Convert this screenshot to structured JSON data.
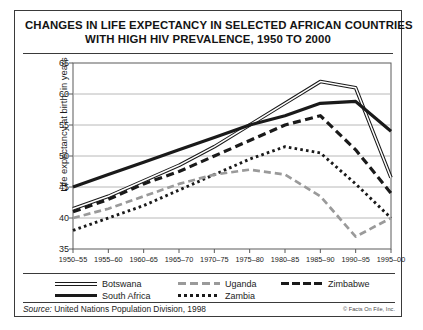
{
  "title": {
    "line1": "CHANGES IN LIFE EXPECTANCY IN SELECTED AFRICAN COUNTRIES",
    "line2": "WITH HIGH HIV PREVALENCE, 1950 TO 2000"
  },
  "source": {
    "prefix": "Source:",
    "text": " United Nations Population Division, 1998",
    "copyright": "© Facts On File, Inc."
  },
  "legend": {
    "items": [
      {
        "label": "Botswana",
        "style": "sw-double",
        "x": 32,
        "y": 4
      },
      {
        "label": "Uganda",
        "style": "sw-grayd",
        "x": 155,
        "y": 4
      },
      {
        "label": "Zimbabwe",
        "style": "sw-boldd",
        "x": 258,
        "y": 4
      },
      {
        "label": "South Africa",
        "style": "sw-solid",
        "x": 32,
        "y": 16
      },
      {
        "label": "Zambia",
        "style": "sw-dot",
        "x": 155,
        "y": 16
      }
    ]
  },
  "chart_data": {
    "type": "line",
    "title": "Changes in life expectancy in selected African countries with high HIV prevalence, 1950 to 2000",
    "xlabel": "",
    "ylabel": "Life expectancy at birth, in years",
    "ylim": [
      35,
      65
    ],
    "yticks": [
      35,
      40,
      45,
      50,
      55,
      60,
      65
    ],
    "grid": true,
    "legend_position": "bottom",
    "categories": [
      "1950–55",
      "1955–60",
      "1960–65",
      "1965–70",
      "1970–75",
      "1975–80",
      "1980–85",
      "1985–90",
      "1990–95",
      "1995–00"
    ],
    "series": [
      {
        "name": "Botswana",
        "style": "double-thin",
        "color": "#1a1a1a",
        "values": [
          41.5,
          43.5,
          46.0,
          48.5,
          51.5,
          55.0,
          58.5,
          62.0,
          61.0,
          46.5
        ]
      },
      {
        "name": "South Africa",
        "style": "bold-solid",
        "color": "#1a1a1a",
        "values": [
          45.0,
          47.0,
          49.0,
          51.0,
          53.0,
          55.0,
          56.5,
          58.5,
          58.8,
          54.0
        ]
      },
      {
        "name": "Zimbabwe",
        "style": "bold-dashed",
        "color": "#1a1a1a",
        "values": [
          41.0,
          43.0,
          45.5,
          47.5,
          50.0,
          52.5,
          55.0,
          56.5,
          51.0,
          44.0
        ]
      },
      {
        "name": "Zambia",
        "style": "dotted",
        "color": "#1a1a1a",
        "values": [
          38.0,
          40.0,
          42.0,
          44.5,
          47.0,
          49.5,
          51.5,
          50.5,
          45.5,
          40.0
        ]
      },
      {
        "name": "Uganda",
        "style": "gray-dashed",
        "color": "#9a9a9a",
        "values": [
          40.0,
          41.5,
          43.5,
          45.5,
          47.0,
          47.8,
          47.0,
          43.5,
          37.0,
          40.0
        ]
      }
    ]
  }
}
